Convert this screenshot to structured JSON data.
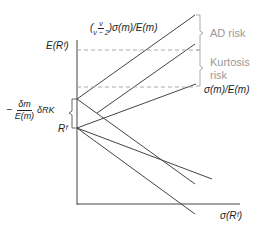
{
  "diagram": {
    "y_axis_label": "E(Rᶠ)",
    "x_axis_label": "σ(Rᶠ)",
    "rf_label": "Rᶠ",
    "top_line_label": {
      "prefix": "(",
      "num": "ν",
      "den": "ν − 2",
      "suffix": ")σ(m)/E(m)"
    },
    "lower_line_label": "σ(m)/E(m)",
    "intercept_label": {
      "minus": "−",
      "num": "δm",
      "den": "E(m)",
      "tail": "δRK"
    },
    "ad_risk_label": "AD risk",
    "kurtosis_label_1": "Kurtosis",
    "kurtosis_label_2": "risk",
    "colors": {
      "line": "#333333",
      "dash": "#999999",
      "gray_text": "#999999"
    }
  }
}
